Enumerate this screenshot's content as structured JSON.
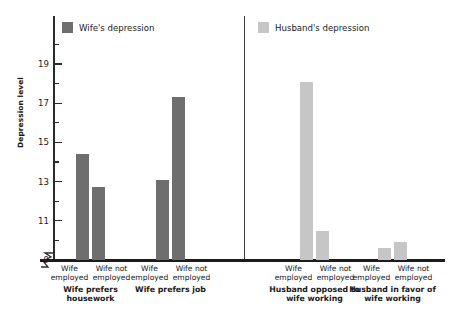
{
  "chart_data": {
    "type": "bar",
    "title": "",
    "xlabel": "",
    "ylabel": "Depression level",
    "ylim": [
      9,
      20
    ],
    "y_ticks_major": [
      9,
      11,
      13,
      15,
      17,
      19
    ],
    "y_ticks_minor": [
      10,
      12,
      14,
      16,
      18,
      20
    ],
    "y_axis_break": true,
    "grid": false,
    "legend_position": "top",
    "legend": [
      {
        "name": "Wife's depression",
        "color": "#6e6e6e"
      },
      {
        "name": "Husband's depression",
        "color": "#c6c6c6"
      }
    ],
    "categories": [
      "Wife employed",
      "Wife not employed"
    ],
    "groups": [
      {
        "title": "Wife prefers housework",
        "series": "Wife's depression",
        "color": "#6e6e6e",
        "bars": [
          {
            "category": "Wife employed",
            "value": 14.4
          },
          {
            "category": "Wife not employed",
            "value": 12.7
          }
        ]
      },
      {
        "title": "Wife prefers job",
        "series": "Wife's depression",
        "color": "#6e6e6e",
        "bars": [
          {
            "category": "Wife employed",
            "value": 13.1
          },
          {
            "category": "Wife not employed",
            "value": 17.3
          }
        ]
      },
      {
        "title": "Husband opposed to wife working",
        "series": "Husband's depression",
        "color": "#c6c6c6",
        "bars": [
          {
            "category": "Wife employed",
            "value": 18.1
          },
          {
            "category": "Wife not employed",
            "value": 10.5
          }
        ]
      },
      {
        "title": "Husband in favor of wife working",
        "series": "Husband's depression",
        "color": "#c6c6c6",
        "bars": [
          {
            "category": "Wife employed",
            "value": 9.6
          },
          {
            "category": "Wife not employed",
            "value": 9.9
          }
        ]
      }
    ]
  },
  "axis": {
    "y_title": "Depression level",
    "tick_labels": [
      "19",
      "17",
      "15",
      "13",
      "11",
      "9"
    ]
  },
  "legend": {
    "wife": "Wife's depression",
    "husband": "Husband's depression"
  },
  "groups": [
    {
      "cat1_line1": "Wife",
      "cat1_line2": "employed",
      "cat2_line1": "Wife not",
      "cat2_line2": "employed",
      "title_line1": "Wife prefers",
      "title_line2": "housework"
    },
    {
      "cat1_line1": "Wife",
      "cat1_line2": "employed",
      "cat2_line1": "Wife not",
      "cat2_line2": "employed",
      "title_line1": "Wife prefers job",
      "title_line2": ""
    },
    {
      "cat1_line1": "Wife",
      "cat1_line2": "employed",
      "cat2_line1": "Wife not",
      "cat2_line2": "employed",
      "title_line1": "Husband opposed to",
      "title_line2": "wife working"
    },
    {
      "cat1_line1": "Wife",
      "cat1_line2": "employed",
      "cat2_line1": "Wife not",
      "cat2_line2": "employed",
      "title_line1": "Husband in favor of",
      "title_line2": "wife working"
    }
  ],
  "colors": {
    "wife_bar": "#6e6e6e",
    "husband_bar": "#c6c6c6",
    "axis": "#2b2b2b",
    "baseline": "#1c1c1c"
  }
}
